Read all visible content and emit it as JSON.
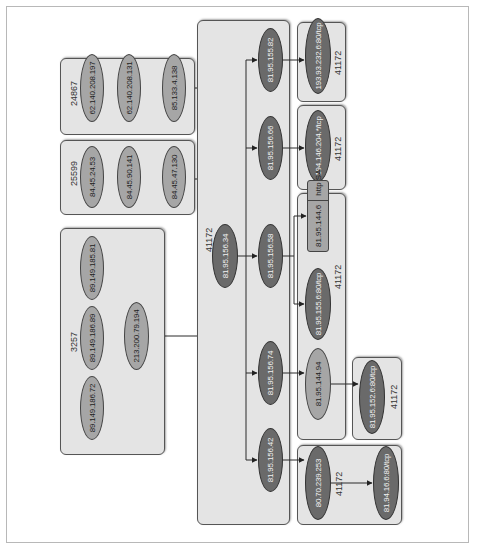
{
  "diagram": {
    "orientation": "rotated 90 degrees counter-clockwise",
    "colors": {
      "box_fill": "#e4e4e4",
      "node_light": "#a6a6a6",
      "node_dark": "#6a6a6a",
      "edge": "#333333"
    },
    "groups": [
      {
        "id": "as24867",
        "label": "24867",
        "nodes": [
          "62.140.208.197",
          "62.140.208.131",
          "85.133.4.138"
        ]
      },
      {
        "id": "as25599",
        "label": "25599",
        "nodes": [
          "84.45.24.53",
          "84.45.90.141",
          "84.45.47.130"
        ]
      },
      {
        "id": "as3257",
        "label": "3257",
        "nodes": [
          "89.149.185.81",
          "89.149.186.89",
          "89.149.186.72",
          "213.200.79.194"
        ]
      },
      {
        "id": "as41172_core",
        "label": "41172",
        "nodes": [
          "81.95.156.34",
          "81.95.155.82",
          "81.95.156.66",
          "81.95.156.58",
          "81.95.156.74",
          "81.95.156.42"
        ]
      },
      {
        "id": "as41172_a",
        "label": "41172",
        "nodes": [
          "193.93.232.6:80/tcp"
        ]
      },
      {
        "id": "as41172_b",
        "label": "41172",
        "nodes": [
          "194.146.204.*/tcp"
        ]
      },
      {
        "id": "as41172_c",
        "label": "41172",
        "nodes": [
          "81.95.144.6 | http SA",
          "81.95.155.6:80/tcp",
          "81.95.144.94"
        ]
      },
      {
        "id": "as41172_d",
        "label": "41172",
        "nodes": [
          "81.95.152.6:80/tcp"
        ]
      },
      {
        "id": "as41172_e",
        "label": "41172",
        "nodes": [
          "80.70.239.253",
          "81.94.16.6:80/tcp"
        ]
      }
    ],
    "nodes": {
      "n62_197": "62.140.208.197",
      "n62_131": "62.140.208.131",
      "n85_138": "85.133.4.138",
      "n84_53": "84.45.24.53",
      "n84_141": "84.45.90.141",
      "n84_130": "84.45.47.130",
      "n89_81": "89.149.185.81",
      "n89_89": "89.149.186.89",
      "n89_72": "89.149.186.72",
      "n213_194": "213.200.79.194",
      "n81_34": "81.95.156.34",
      "n81_82": "81.95.155.82",
      "n81_66": "81.95.156.66",
      "n81_58": "81.95.156.58",
      "n81_74": "81.95.156.74",
      "n81_42": "81.95.156.42",
      "n193": "193.93.232.6:80/tcp",
      "n194": "194.146.204.*/tcp",
      "n144_6_ip": "81.95.144.6",
      "n144_6_flag": "http SA",
      "n155_6": "81.95.155.6:80/tcp",
      "n144_94": "81.95.144.94",
      "n152_6": "81.95.152.6:80/tcp",
      "n80_253": "80.70.239.253",
      "n81_94": "81.94.16.6:80/tcp"
    },
    "edges": [
      [
        "62.140.208.197",
        "62.140.208.131"
      ],
      [
        "62.140.208.131",
        "85.133.4.138"
      ],
      [
        "85.133.4.138",
        "81.95.156.34"
      ],
      [
        "84.45.24.53",
        "84.45.90.141"
      ],
      [
        "84.45.90.141",
        "84.45.47.130"
      ],
      [
        "84.45.47.130",
        "81.95.156.34"
      ],
      [
        "89.149.185.81",
        "213.200.79.194"
      ],
      [
        "89.149.186.89",
        "213.200.79.194"
      ],
      [
        "89.149.186.72",
        "213.200.79.194"
      ],
      [
        "213.200.79.194",
        "81.95.156.34"
      ],
      [
        "81.95.156.34",
        "81.95.155.82"
      ],
      [
        "81.95.156.34",
        "81.95.156.66"
      ],
      [
        "81.95.156.34",
        "81.95.156.58"
      ],
      [
        "81.95.156.34",
        "81.95.156.74"
      ],
      [
        "81.95.156.34",
        "81.95.156.42"
      ],
      [
        "81.95.155.82",
        "193.93.232.6:80/tcp"
      ],
      [
        "81.95.156.66",
        "194.146.204.*/tcp"
      ],
      [
        "81.95.156.58",
        "81.95.144.6"
      ],
      [
        "81.95.156.58",
        "81.95.155.6:80/tcp"
      ],
      [
        "81.95.156.74",
        "81.95.144.94"
      ],
      [
        "81.95.144.94",
        "81.95.152.6:80/tcp"
      ],
      [
        "81.95.156.42",
        "80.70.239.253"
      ],
      [
        "80.70.239.253",
        "81.94.16.6:80/tcp"
      ]
    ]
  }
}
